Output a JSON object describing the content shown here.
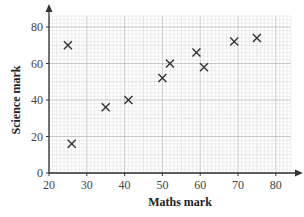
{
  "chart_data": {
    "type": "scatter",
    "title": "",
    "xlabel": "Maths mark",
    "ylabel": "Science mark",
    "xlim": [
      20,
      85
    ],
    "ylim": [
      0,
      88
    ],
    "x_ticks": [
      20,
      30,
      40,
      50,
      60,
      70,
      80
    ],
    "y_ticks": [
      0,
      20,
      40,
      60,
      80
    ],
    "grid": true,
    "marker": "x",
    "series": [
      {
        "name": "Students",
        "points": [
          {
            "x": 25,
            "y": 70
          },
          {
            "x": 26,
            "y": 16
          },
          {
            "x": 35,
            "y": 36
          },
          {
            "x": 41,
            "y": 40
          },
          {
            "x": 50,
            "y": 52
          },
          {
            "x": 52,
            "y": 60
          },
          {
            "x": 59,
            "y": 66
          },
          {
            "x": 61,
            "y": 58
          },
          {
            "x": 69,
            "y": 72
          },
          {
            "x": 75,
            "y": 74
          }
        ]
      }
    ]
  },
  "colors": {
    "grid_minor": "#dddddd",
    "grid_major": "#bbbbbb",
    "axis": "#333333",
    "marker": "#333333"
  }
}
